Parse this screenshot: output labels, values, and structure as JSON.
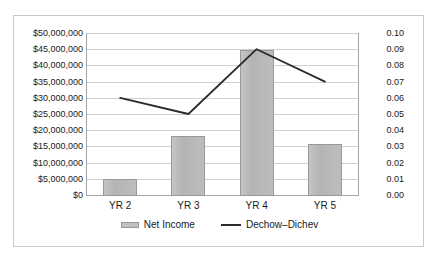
{
  "chart_data": {
    "type": "bar",
    "title": "",
    "subtitle": "",
    "xlabel": "",
    "ylabel": "",
    "categories": [
      "YR 2",
      "YR 3",
      "YR 4",
      "YR 5"
    ],
    "grid": true,
    "legend_position": "bottom",
    "series": [
      {
        "name": "Net Income",
        "type": "bar",
        "axis": "left",
        "color": "#bdbdbd",
        "values": [
          5200000,
          18500000,
          45000000,
          16200000
        ]
      },
      {
        "name": "Dechow–Dichev",
        "type": "line",
        "axis": "right",
        "color": "#2b2b2b",
        "values": [
          0.06,
          0.05,
          0.09,
          0.07
        ]
      }
    ],
    "left_axis": {
      "min": 0,
      "max": 50000000,
      "step": 5000000,
      "ticks": [
        "$50,000,000",
        "$45,000,000",
        "$40,000,000",
        "$35,000,000",
        "$30,000,000",
        "$25,000,000",
        "$20,000,000",
        "$15,000,000",
        "$10,000,000",
        "$5,000,000",
        "$0"
      ]
    },
    "right_axis": {
      "min": 0,
      "max": 0.1,
      "step": 0.01,
      "ticks": [
        "0.10",
        "0.09",
        "0.08",
        "0.07",
        "0.06",
        "0.05",
        "0.04",
        "0.03",
        "0.02",
        "0.01",
        "0.00"
      ]
    },
    "legend": [
      {
        "label": "Net Income",
        "marker": "bar-swatch"
      },
      {
        "label": "Dechow–Dichev",
        "marker": "line-swatch"
      }
    ]
  }
}
